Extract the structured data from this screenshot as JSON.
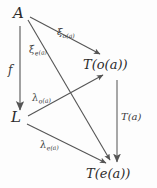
{
  "diagram": {
    "type": "commutative-diagram",
    "background_color": "#fdfdfd",
    "ink_color": "#555555",
    "text_color": "#2b2b2b",
    "nodes": [
      {
        "id": "A",
        "label": "A",
        "x": 20,
        "y": 15
      },
      {
        "id": "L",
        "label": "L",
        "x": 17,
        "y": 118
      },
      {
        "id": "T_o_a",
        "label": "T(o(a))",
        "x": 112,
        "y": 66
      },
      {
        "id": "T_e_a",
        "label": "T(e(a))",
        "x": 117,
        "y": 175
      }
    ],
    "edges": [
      {
        "id": "xi_o",
        "from": "A",
        "to": "T_o_a",
        "label": "ξ",
        "subscript": "o(a)"
      },
      {
        "id": "xi_e",
        "from": "A",
        "to": "T_e_a",
        "label": "ξ",
        "subscript": "e(a)"
      },
      {
        "id": "f",
        "from": "A",
        "to": "L",
        "label": "f",
        "subscript": ""
      },
      {
        "id": "lambda_o",
        "from": "L",
        "to": "T_o_a",
        "label": "λ",
        "subscript": "o(a)"
      },
      {
        "id": "lambda_e",
        "from": "L",
        "to": "T_e_a",
        "label": "λ",
        "subscript": "e(a)"
      },
      {
        "id": "T_a",
        "from": "T_o_a",
        "to": "T_e_a",
        "label": "T(a)",
        "subscript": ""
      }
    ]
  }
}
